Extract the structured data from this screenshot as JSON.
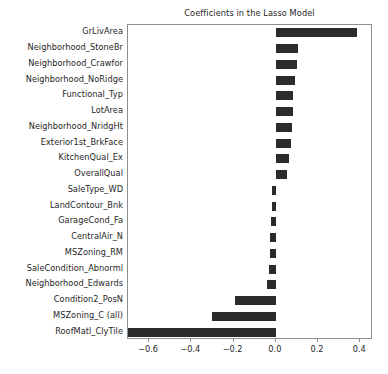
{
  "chart_data": {
    "type": "bar",
    "orientation": "horizontal",
    "title": "Coefficients in the Lasso Model",
    "xlabel": "",
    "ylabel": "",
    "xlim": [
      -0.7,
      0.46
    ],
    "xticks": [
      -0.6,
      -0.4,
      -0.2,
      0.0,
      0.2,
      0.4
    ],
    "xtick_labels": [
      "−0.6",
      "−0.4",
      "−0.2",
      "0.0",
      "0.2",
      "0.4"
    ],
    "grid": false,
    "legend": null,
    "bar_color": "#2b2b2b",
    "categories": [
      "GrLivArea",
      "Neighborhood_StoneBr",
      "Neighborhood_Crawfor",
      "Neighborhood_NoRidge",
      "Functional_Typ",
      "LotArea",
      "Neighborhood_NridgHt",
      "Exterior1st_BrkFace",
      "KitchenQual_Ex",
      "OverallQual",
      "SaleType_WD",
      "LandContour_Bnk",
      "GarageCond_Fa",
      "CentralAir_N",
      "MSZoning_RM",
      "SaleCondition_Abnorml",
      "Neighborhood_Edwards",
      "Condition2_PosN",
      "MSZoning_C (all)",
      "RoofMatl_ClyTile"
    ],
    "values": [
      0.385,
      0.105,
      0.1,
      0.09,
      0.083,
      0.079,
      0.075,
      0.07,
      0.064,
      0.052,
      -0.018,
      -0.02,
      -0.022,
      -0.026,
      -0.03,
      -0.034,
      -0.04,
      -0.195,
      -0.3,
      -0.7
    ]
  },
  "figure": {
    "background": "#ffffff",
    "axes_edge_color": "#8f8f8f",
    "text_color": "#262626"
  }
}
